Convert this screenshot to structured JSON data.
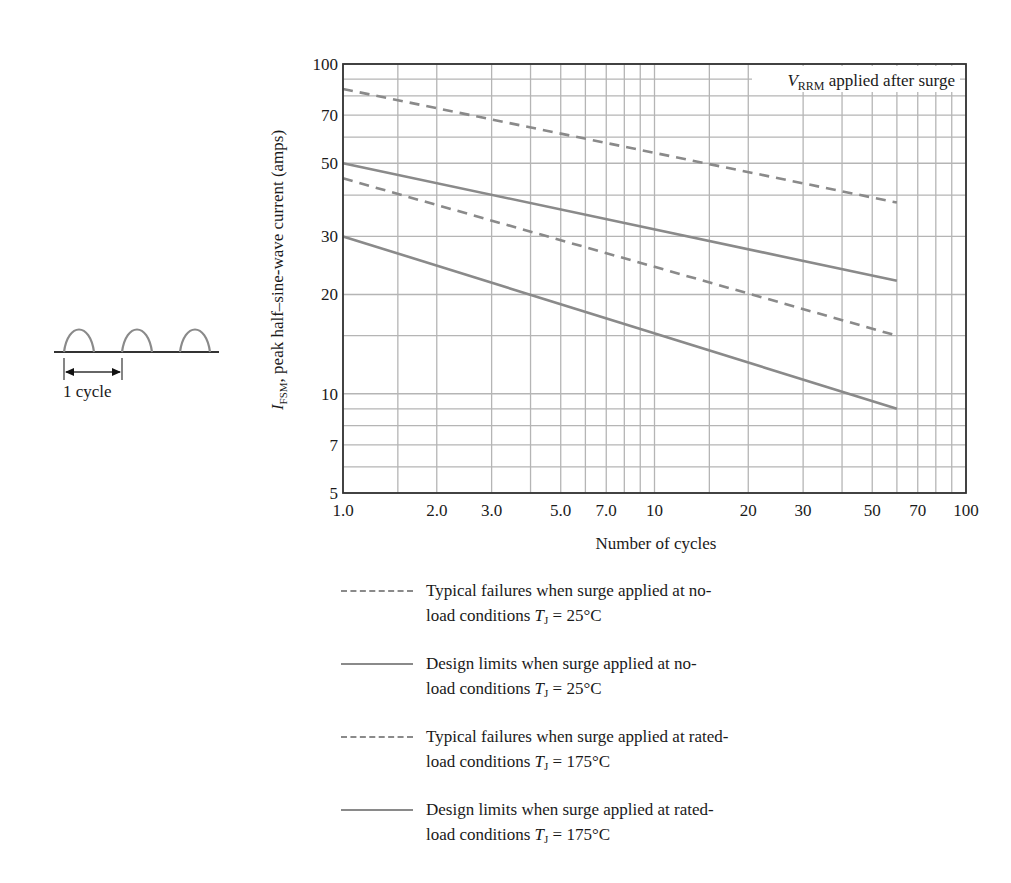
{
  "chart_data": {
    "type": "line",
    "title": "",
    "xlabel": "Number of cycles",
    "ylabel": "I_FSM, peak half-sine-wave current (amps)",
    "ylabel_symbol": "I",
    "ylabel_subscript": "FSM",
    "ylabel_rest": ", peak half–sine-wave current (amps)",
    "xscale": "log",
    "yscale": "log",
    "xlim": [
      1,
      100
    ],
    "ylim": [
      5,
      100
    ],
    "grid": true,
    "x_ticks": [
      {
        "value": 1,
        "label": "1.0"
      },
      {
        "value": 2,
        "label": "2.0"
      },
      {
        "value": 3,
        "label": "3.0"
      },
      {
        "value": 5,
        "label": "5.0"
      },
      {
        "value": 7,
        "label": "7.0"
      },
      {
        "value": 10,
        "label": "10"
      },
      {
        "value": 20,
        "label": "20"
      },
      {
        "value": 30,
        "label": "30"
      },
      {
        "value": 50,
        "label": "50"
      },
      {
        "value": 70,
        "label": "70"
      },
      {
        "value": 100,
        "label": "100"
      }
    ],
    "y_ticks": [
      {
        "value": 5,
        "label": "5"
      },
      {
        "value": 7,
        "label": "7"
      },
      {
        "value": 10,
        "label": "10"
      },
      {
        "value": 20,
        "label": "20"
      },
      {
        "value": 30,
        "label": "30"
      },
      {
        "value": 50,
        "label": "50"
      },
      {
        "value": 70,
        "label": "70"
      },
      {
        "value": 100,
        "label": "100"
      }
    ],
    "x_grid": [
      1,
      1.5,
      2,
      3,
      4,
      5,
      6,
      7,
      8,
      9,
      10,
      15,
      20,
      30,
      40,
      50,
      60,
      70,
      80,
      90,
      100
    ],
    "y_grid": [
      5,
      6,
      7,
      8,
      9,
      10,
      15,
      20,
      30,
      40,
      50,
      60,
      70,
      80,
      90,
      100
    ],
    "annotation": {
      "symbol": "V",
      "subscript": "RRM",
      "text": " applied after surge"
    },
    "series": [
      {
        "name": "Typical failures when surge applied at no-load conditions TJ = 25°C",
        "style": "dashed",
        "x": [
          1,
          60
        ],
        "y": [
          84,
          38
        ]
      },
      {
        "name": "Design limits when surge applied at no-load conditions TJ = 25°C",
        "style": "solid",
        "x": [
          1,
          60
        ],
        "y": [
          50,
          22
        ]
      },
      {
        "name": "Typical failures when surge applied at rated-load conditions TJ = 175°C",
        "style": "dashed",
        "x": [
          1,
          60
        ],
        "y": [
          45,
          15
        ]
      },
      {
        "name": "Design limits when surge applied at rated-load conditions TJ = 175°C",
        "style": "solid",
        "x": [
          1,
          60
        ],
        "y": [
          30,
          9
        ]
      }
    ],
    "colors": {
      "curve": "#8a8a8a",
      "grid": "#b5b5b5",
      "axis": "#333333"
    }
  },
  "legend": {
    "items": [
      {
        "style": "dashed",
        "line1": "Typical failures when surge applied at no-",
        "line2_prefix": "load conditions ",
        "sym": "T",
        "sub": "J",
        "line2_suffix": " = 25°C"
      },
      {
        "style": "solid",
        "line1": "Design limits when surge applied at no-",
        "line2_prefix": "load conditions ",
        "sym": "T",
        "sub": "J",
        "line2_suffix": " = 25°C"
      },
      {
        "style": "dashed",
        "line1": "Typical failures when surge applied at rated-",
        "line2_prefix": "load conditions ",
        "sym": "T",
        "sub": "J",
        "line2_suffix": " = 175°C"
      },
      {
        "style": "solid",
        "line1": "Design limits when surge applied at rated-",
        "line2_prefix": "load conditions ",
        "sym": "T",
        "sub": "J",
        "line2_suffix": " = 175°C"
      }
    ]
  },
  "waveform_inset": {
    "label": "1 cycle",
    "pulses": 3
  }
}
